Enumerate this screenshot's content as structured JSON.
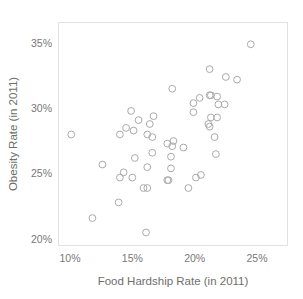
{
  "chart_data": {
    "type": "scatter",
    "title": "",
    "xlabel": "Food Hardship Rate (in 2011)",
    "ylabel": "Obesity Rate (in 2011)",
    "xlim": [
      9.0,
      26.5
    ],
    "ylim": [
      19.2,
      35.9
    ],
    "grid": false,
    "legend": null,
    "xticks": [
      "10%",
      "15%",
      "20%",
      "25%"
    ],
    "xtick_values": [
      10,
      15,
      20,
      25
    ],
    "yticks": [
      "20%",
      "25%",
      "30%",
      "35%"
    ],
    "ytick_values": [
      20,
      25,
      30,
      35
    ],
    "marker": "open-circle",
    "marker_color": "#aaaaaa",
    "point_count": 51,
    "points": [
      {
        "x": 24.5,
        "y": 34.9
      },
      {
        "x": 21.2,
        "y": 33.0
      },
      {
        "x": 22.5,
        "y": 32.4
      },
      {
        "x": 23.4,
        "y": 32.2
      },
      {
        "x": 18.2,
        "y": 31.5
      },
      {
        "x": 21.2,
        "y": 31.0
      },
      {
        "x": 21.3,
        "y": 31.0
      },
      {
        "x": 21.8,
        "y": 30.9
      },
      {
        "x": 20.4,
        "y": 30.8
      },
      {
        "x": 19.9,
        "y": 30.4
      },
      {
        "x": 21.9,
        "y": 30.3
      },
      {
        "x": 22.4,
        "y": 30.3
      },
      {
        "x": 14.9,
        "y": 29.8
      },
      {
        "x": 19.9,
        "y": 29.7
      },
      {
        "x": 16.7,
        "y": 29.4
      },
      {
        "x": 21.3,
        "y": 29.3
      },
      {
        "x": 21.8,
        "y": 29.3
      },
      {
        "x": 15.5,
        "y": 29.1
      },
      {
        "x": 16.4,
        "y": 28.8
      },
      {
        "x": 21.1,
        "y": 28.8
      },
      {
        "x": 21.2,
        "y": 28.6
      },
      {
        "x": 14.5,
        "y": 28.5
      },
      {
        "x": 15.1,
        "y": 28.3
      },
      {
        "x": 10.1,
        "y": 28.0
      },
      {
        "x": 14.0,
        "y": 28.0
      },
      {
        "x": 16.2,
        "y": 28.0
      },
      {
        "x": 16.6,
        "y": 27.8
      },
      {
        "x": 21.6,
        "y": 27.8
      },
      {
        "x": 18.3,
        "y": 27.5
      },
      {
        "x": 17.8,
        "y": 27.3
      },
      {
        "x": 18.2,
        "y": 27.1
      },
      {
        "x": 19.1,
        "y": 27.0
      },
      {
        "x": 16.6,
        "y": 26.6
      },
      {
        "x": 21.7,
        "y": 26.5
      },
      {
        "x": 18.1,
        "y": 26.3
      },
      {
        "x": 15.2,
        "y": 26.2
      },
      {
        "x": 12.6,
        "y": 25.7
      },
      {
        "x": 16.2,
        "y": 25.5
      },
      {
        "x": 18.1,
        "y": 25.4
      },
      {
        "x": 14.3,
        "y": 25.1
      },
      {
        "x": 20.5,
        "y": 24.9
      },
      {
        "x": 14.0,
        "y": 24.7
      },
      {
        "x": 15.0,
        "y": 24.7
      },
      {
        "x": 20.1,
        "y": 24.7
      },
      {
        "x": 17.8,
        "y": 24.5
      },
      {
        "x": 17.9,
        "y": 24.5
      },
      {
        "x": 15.9,
        "y": 23.9
      },
      {
        "x": 16.2,
        "y": 23.9
      },
      {
        "x": 19.5,
        "y": 23.9
      },
      {
        "x": 13.9,
        "y": 22.8
      },
      {
        "x": 11.8,
        "y": 21.6
      },
      {
        "x": 16.1,
        "y": 20.5
      }
    ]
  },
  "axes": {
    "x_title": "Food Hardship Rate (in 2011)",
    "y_title": "Obesity Rate (in 2011)",
    "x_tick_labels": [
      "10%",
      "15%",
      "20%",
      "25%"
    ],
    "y_tick_labels": [
      "20%",
      "25%",
      "30%",
      "35%"
    ]
  },
  "style": {
    "background": "#ffffff",
    "frame_color": "#e2e2e2",
    "marker_stroke": "#aaaaaa",
    "text_color": "#757575"
  }
}
